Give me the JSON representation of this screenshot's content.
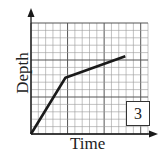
{
  "chart_data": {
    "type": "line",
    "title": "",
    "xlabel": "Time",
    "ylabel": "Depth",
    "grid": true,
    "grid_columns": 16,
    "grid_rows": 15,
    "xlim": [
      0,
      16
    ],
    "ylim": [
      0,
      15
    ],
    "tick_labels": {
      "x": [],
      "y": []
    },
    "series": [
      {
        "name": "depth",
        "points": [
          [
            0,
            0
          ],
          [
            4.7,
            7.6
          ],
          [
            12.9,
            10.5
          ]
        ]
      }
    ],
    "annotations": [
      {
        "text": "3",
        "position": "bottom-right",
        "boxed": true
      }
    ],
    "legend": null
  },
  "labels": {
    "x": "Time",
    "y": "Depth",
    "panel": "3"
  },
  "colors": {
    "line": "#1a1a1a",
    "grid": "#9a9a9a",
    "grid_major": "#555555",
    "axis": "#1a1a1a"
  }
}
